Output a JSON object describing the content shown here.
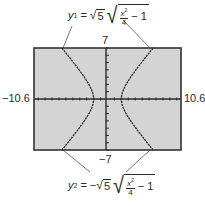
{
  "equations": {
    "top": {
      "var": "y",
      "sub": "1",
      "eq": "=",
      "sign": "",
      "coef": "5",
      "num": "x",
      "exp": "2",
      "den": "4",
      "tail": "− 1"
    },
    "bottom": {
      "var": "y",
      "sub": "2",
      "eq": "=",
      "sign": "−",
      "coef": "5",
      "num": "x",
      "exp": "2",
      "den": "4",
      "tail": "− 1"
    }
  },
  "window": {
    "xmin_label": "−10.6",
    "xmax_label": "10.6",
    "ymax_label": "7",
    "ymin_label": "−7",
    "xmin": -10.6,
    "xmax": 10.6,
    "ymin": -7,
    "ymax": 7
  },
  "colors": {
    "screen_bg": "#d4d4d4",
    "frame": "#333333",
    "curve": "#2a2a2a",
    "axis": "#2a2a2a",
    "leader": "#555555"
  }
}
